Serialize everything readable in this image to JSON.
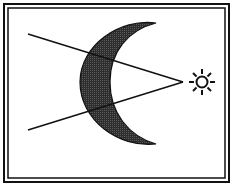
{
  "diagram": {
    "colors": {
      "background": "#ffffff",
      "stroke": "#111111",
      "crescent_fill": "#3a3a3a"
    },
    "icons": {
      "sun": "sun-icon",
      "moon": "crescent-moon-icon"
    }
  }
}
